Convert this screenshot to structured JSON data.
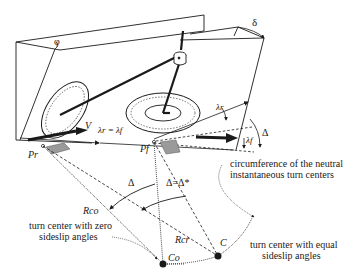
{
  "diagram": {
    "type": "vehicle turning kinematics schematic",
    "angles": {
      "roll": "φ",
      "steer": "δ",
      "rear_slip": "λr",
      "front_slip": "λf",
      "equal_slip": "λr = λf",
      "kinematic_steer": "Δ",
      "kinematic_steer_eq": "Δ=Δ*"
    },
    "labels": {
      "velocity": "V",
      "rear_contact": "Pr",
      "front_contact": "Pf",
      "radius_zero": "Rco",
      "radius_equal": "Rcr",
      "center_zero": "Co",
      "center_equal": "C"
    },
    "annotations": {
      "circumference_line1": "circumference of the neutral",
      "circumference_line2": "instantaneous turn centers",
      "zero_line1": "turn center with zero",
      "zero_line2": "sideslip angles",
      "equal_line1": "turn center with equal",
      "equal_line2": "sideslip angles"
    },
    "colors": {
      "ink": "#1a1a1a",
      "contact_patch": "#9a9a9a",
      "background": "#ffffff"
    }
  }
}
